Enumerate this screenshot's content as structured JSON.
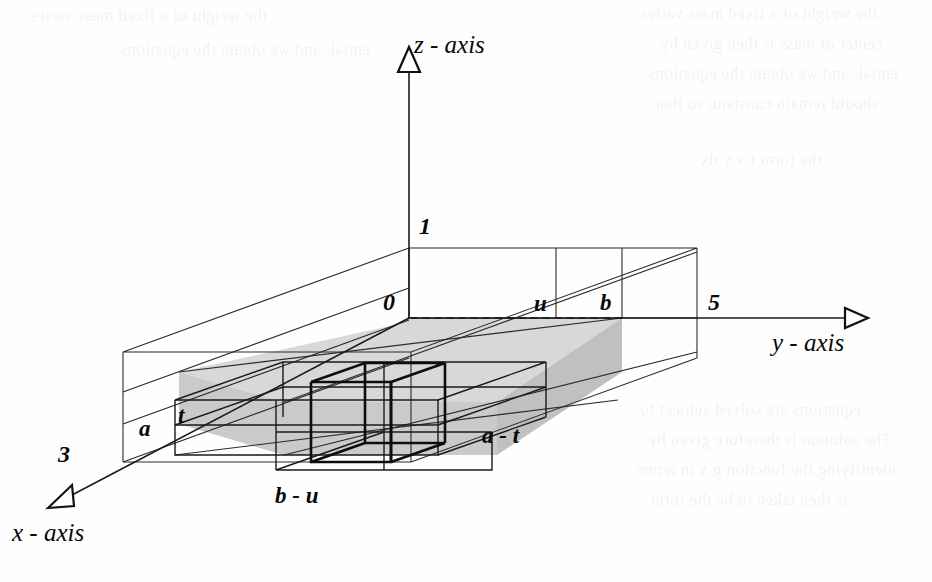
{
  "figure": {
    "kind": "3d-box-diagram",
    "axes": [
      {
        "id": "z",
        "label": "z - axis",
        "arrow": "triangle-up"
      },
      {
        "id": "y",
        "label": "y - axis",
        "arrow": "triangle-right"
      },
      {
        "id": "x",
        "label": "x - axis",
        "arrow": "triangle-down-left"
      }
    ],
    "axis_labels": {
      "z": "z - axis",
      "y": "y - axis",
      "x": "x - axis"
    },
    "intercepts": [
      {
        "name": "origin-ish-0",
        "text": "0"
      },
      {
        "name": "z-intercept",
        "text": "1"
      },
      {
        "name": "y-intercept",
        "text": "3"
      },
      {
        "name": "x-intercept",
        "text": "5"
      }
    ],
    "dimension_labels": [
      {
        "name": "a",
        "text": "a"
      },
      {
        "name": "t",
        "text": "t"
      },
      {
        "name": "a-minus-t",
        "text": "a - t"
      },
      {
        "name": "u",
        "text": "u"
      },
      {
        "name": "b",
        "text": "b"
      },
      {
        "name": "b-minus-u",
        "text": "b - u"
      }
    ],
    "colors": {
      "line": "#1a1a1a",
      "thin_line": "#3a3a3a",
      "shade_fill": "#d6d6d6",
      "shade_fill_dark": "#c2c2c2",
      "background": "#fefefe",
      "bold_cube": "#111111"
    }
  },
  "bleed_through": {
    "note": "faint mirrored show-through text from the reverse side of the printed page",
    "lines": [
      "the weight of a fixed mass varies",
      "center of mass is then given by",
      "ential, and we obtain the equations",
      "should remain constant, so that",
      "the form f x y dx",
      "equations are solved subject to",
      "The solution is therefore given by",
      "identifying the function g x in terms",
      "is then taken to be the form"
    ]
  }
}
